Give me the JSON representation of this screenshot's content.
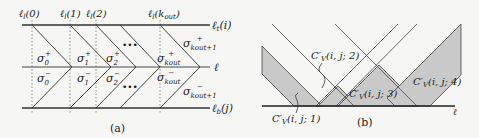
{
  "panel_a": {
    "caption": "(a)",
    "top_labels": [
      "ℓl(0)",
      "ℓl(1)",
      "ℓl(2)",
      "ℓl(kout)"
    ],
    "line_labels": {
      "top": "ℓt(i)",
      "middle": "ℓ",
      "bottom": "ℓb(j)"
    },
    "sigma_plus": [
      "σ0+",
      "σ1+",
      "σ2+",
      "σkout+",
      "σkout+1+"
    ],
    "sigma_minus": [
      "σ0−",
      "σ1−",
      "σ2−",
      "σkout−",
      "σkout+1−"
    ],
    "ellipsis": "•••"
  },
  "panel_b": {
    "caption": "(b)",
    "baseline_label": "ℓ",
    "regions": [
      "C'V(i,j;1)",
      "C'V(i,j;2)",
      "C'V(i,j;3)",
      "C'V(i,j;4)"
    ],
    "fill_color": "#c8c8c8"
  }
}
